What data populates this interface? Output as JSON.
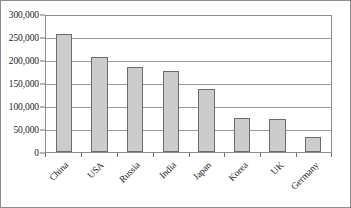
{
  "chart_data": {
    "type": "bar",
    "title": "",
    "subtitle": "",
    "xlabel": "",
    "ylabel": "",
    "categories": [
      "China",
      "USA",
      "Russia",
      "India",
      "Japan",
      "Korea",
      "UK",
      "Germany"
    ],
    "values": [
      256000,
      206000,
      184000,
      176000,
      137000,
      75000,
      71000,
      33000
    ],
    "ylim": [
      0,
      300000
    ],
    "yticks": [
      0,
      50000,
      100000,
      150000,
      200000,
      250000,
      300000
    ],
    "ytick_labels": [
      "0",
      "50,000",
      "100,000",
      "150,000",
      "200,000",
      "250,000",
      "300,000"
    ],
    "grid": "horizontal",
    "legend": "none",
    "bar_fill_color": "#cccccc",
    "bar_border_color": "#6b6b6b",
    "gridline_color": "#9a9a9a",
    "axis_color": "#8c8c8c",
    "text_color": "#1a1a1a",
    "xtick_label_rotation": -45
  }
}
